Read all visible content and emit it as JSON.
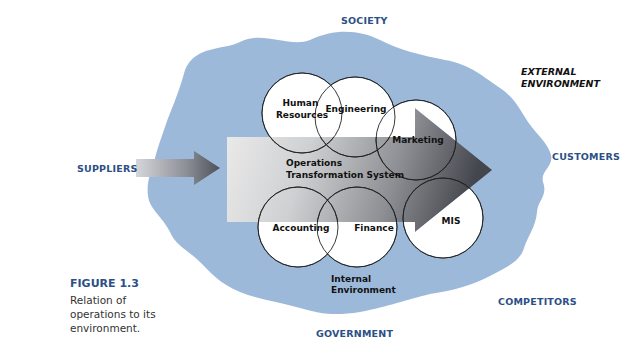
{
  "figure": {
    "number": "FIGURE 1.3",
    "caption_lines": [
      "Relation of",
      "operations to its",
      "environment."
    ]
  },
  "external": {
    "heading_lines": [
      "EXTERNAL",
      "ENVIRONMENT"
    ],
    "stakeholders": {
      "top": "SOCIETY",
      "left": "SUPPLIERS",
      "right": "CUSTOMERS",
      "bottom_right": "COMPETITORS",
      "bottom": "GOVERNMENT"
    }
  },
  "internal": {
    "label_lines": [
      "Internal",
      "Environment"
    ],
    "core": {
      "label_lines": [
        "Operations",
        "Transformation System"
      ]
    },
    "functions": [
      {
        "id": "human-resources",
        "label_lines": [
          "Human",
          "Resources"
        ]
      },
      {
        "id": "engineering",
        "label_lines": [
          "Engineering"
        ]
      },
      {
        "id": "marketing",
        "label_lines": [
          "Marketing"
        ]
      },
      {
        "id": "accounting",
        "label_lines": [
          "Accounting"
        ]
      },
      {
        "id": "finance",
        "label_lines": [
          "Finance"
        ]
      },
      {
        "id": "mis",
        "label_lines": [
          "MIS"
        ]
      }
    ]
  },
  "colors": {
    "cloud": "#9db9da",
    "stakeholder_text": "#2c4f86",
    "arrow_dark": "#4a4d55",
    "arrow_light": "#e6e6e6"
  }
}
